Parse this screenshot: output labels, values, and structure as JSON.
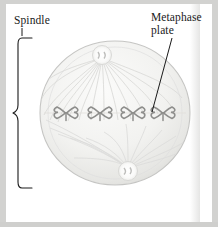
{
  "figure": {
    "background_color": "#d2d2d0",
    "paper_color": "#ffffff"
  },
  "labels": {
    "spindle": "Spindle",
    "metaphase_plate": "Metaphase\nplate"
  },
  "diagram": {
    "cell": {
      "center_x": 115,
      "center_y": 113,
      "radius_x": 75,
      "radius_y": 72,
      "membrane_color": "#c5c5c3",
      "cytoplasm_color": "#f3f3f1"
    },
    "poles": [
      {
        "name": "top-centrosome",
        "x": 102,
        "y": 55,
        "r": 9
      },
      {
        "name": "bottom-centrosome",
        "x": 128,
        "y": 171,
        "r": 9
      }
    ],
    "spindle_fiber_color": "#d8d8d6",
    "chromosome_color": "#8e8e8c",
    "chromosomes": [
      {
        "x": 66,
        "y": 113
      },
      {
        "x": 100,
        "y": 113
      },
      {
        "x": 133,
        "y": 113
      },
      {
        "x": 163,
        "y": 113
      }
    ],
    "metaphase_plate_y": 113,
    "brace": {
      "x": 18,
      "top_y": 38,
      "bottom_y": 188,
      "tip_y": 113,
      "arm_length": 14,
      "color": "#1a1a1a"
    },
    "leader_line": {
      "from_x": 172,
      "from_y": 38,
      "to_x": 152,
      "to_y": 112,
      "color": "#1a1a1a"
    },
    "spindle_tick": {
      "x": 22,
      "top_y": 28,
      "bottom_y": 36
    }
  }
}
